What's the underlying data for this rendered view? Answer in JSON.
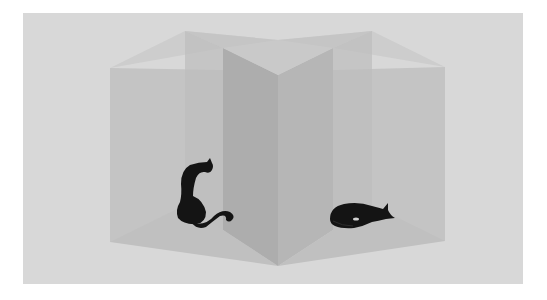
{
  "image": {
    "description": "Ambiguous folded-panel illusion: translucent gray boxes/panels with two black cat silhouettes",
    "colors": {
      "page_margin": "#ffffff",
      "background": "#d8d8d8",
      "panel_light": "#c6c6c6",
      "panel_mid": "#b9b9b9",
      "panel_dark": "#acacac",
      "cat": "#141414"
    },
    "figures": [
      {
        "name": "sitting-cat",
        "pose": "sitting, facing right, curled tail"
      },
      {
        "name": "sleeping-cat",
        "pose": "lying curled up, head to the right"
      }
    ]
  }
}
